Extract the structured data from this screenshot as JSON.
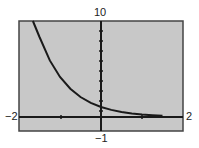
{
  "chart_data": {
    "type": "line",
    "title": "",
    "function": "y = (1/4)^x",
    "xlabel": "",
    "ylabel": "",
    "xlim": [
      -2,
      2
    ],
    "ylim": [
      -1,
      10
    ],
    "x": [
      -1.66,
      -1.5,
      -1.25,
      -1.0,
      -0.75,
      -0.5,
      -0.25,
      0,
      0.25,
      0.5,
      0.75,
      1.0,
      1.25,
      1.5
    ],
    "values": [
      10,
      8,
      5.66,
      4,
      2.83,
      2,
      1.41,
      1,
      0.71,
      0.5,
      0.35,
      0.25,
      0.18,
      0.13
    ],
    "grid": false,
    "window_labels": {
      "xmin": "−2",
      "xmax": "2",
      "ymin": "−1",
      "ymax": "10"
    },
    "colors": {
      "screen": "#c8c8c8",
      "curve": "#1a1a1a",
      "frame": "#333333"
    }
  }
}
